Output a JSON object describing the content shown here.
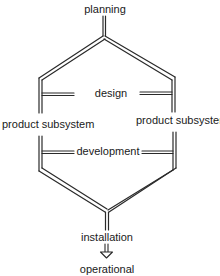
{
  "diagram": {
    "type": "process-flow",
    "colors": {
      "line": "#2a2a2a",
      "text": "#1a1a1a",
      "background": "#ffffff"
    },
    "labels": {
      "planning": "planning",
      "design": "design",
      "product_subsystem_left": "product subsystem",
      "product_subsystem_right": "product subsystem",
      "development": "development",
      "installation": "installation",
      "operational": "operational"
    },
    "stages": [
      "planning",
      "design",
      "product subsystem",
      "development",
      "installation",
      "operational"
    ]
  }
}
